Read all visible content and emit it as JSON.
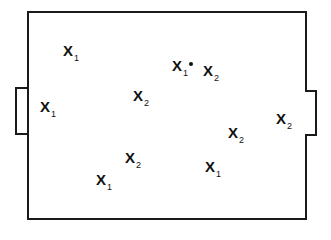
{
  "diagram": {
    "type": "field-positions",
    "colors": {
      "line": "#1a1a1a",
      "text": "#111111",
      "background": "#ffffff"
    },
    "players": [
      {
        "label": "X",
        "team": "1",
        "x": 63,
        "y": 43,
        "ball": false
      },
      {
        "label": "X",
        "team": "1",
        "x": 40,
        "y": 99,
        "ball": false
      },
      {
        "label": "X",
        "team": "2",
        "x": 133,
        "y": 88,
        "ball": false
      },
      {
        "label": "X",
        "team": "1",
        "x": 172,
        "y": 58,
        "ball": true
      },
      {
        "label": "X",
        "team": "2",
        "x": 203,
        "y": 63,
        "ball": false
      },
      {
        "label": "X",
        "team": "2",
        "x": 228,
        "y": 125,
        "ball": false
      },
      {
        "label": "X",
        "team": "2",
        "x": 276,
        "y": 111,
        "ball": false
      },
      {
        "label": "X",
        "team": "2",
        "x": 125,
        "y": 150,
        "ball": false
      },
      {
        "label": "X",
        "team": "1",
        "x": 96,
        "y": 172,
        "ball": false
      },
      {
        "label": "X",
        "team": "1",
        "x": 205,
        "y": 159,
        "ball": false
      }
    ]
  }
}
